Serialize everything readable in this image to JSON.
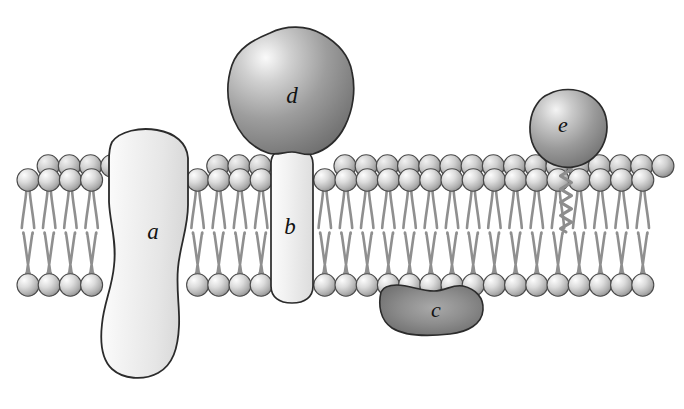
{
  "figure": {
    "background_color": "#ffffff",
    "width": 684,
    "height": 409
  },
  "palette": {
    "outline": "#2b2b2b",
    "head_light": "#f2f2f2",
    "head_mid": "#b9b9b9",
    "head_dark": "#8d8d8d",
    "tail": "#8f8f8f",
    "protein_light_fill": "#ececec",
    "protein_light_highlight": "#fbfbfb",
    "protein_dark_fill": "#8a8a8a",
    "protein_dark_shadow": "#6d6d6d",
    "protein_dark_highlight": "#e8e8e8",
    "label_color": "#121212"
  },
  "membrane": {
    "name": "phospholipid-bilayer",
    "left_x": 28,
    "right_x": 662,
    "outer_leaflet": {
      "name": "outer-leaflet",
      "rows": 2,
      "row_layout": "staggered-double-row",
      "back_row_y": 166,
      "front_row_y": 180,
      "head_radius": 11,
      "spacing": 21.2,
      "tail_top_y": 190,
      "tail_bottom_y": 228
    },
    "inner_leaflet": {
      "name": "inner-leaflet",
      "rows": 1,
      "row_layout": "single-row",
      "head_row_y": 285,
      "head_radius": 11,
      "spacing": 21.2,
      "tail_top_y": 234,
      "tail_bottom_y": 273
    },
    "midline_y": 231,
    "tail_pair_splay": 5.4,
    "tail_width": 2.6
  },
  "proteins": [
    {
      "id": "a",
      "label": "a",
      "name": "protein-a",
      "type": "integral-transmembrane",
      "shade": "light",
      "label_x": 153,
      "label_y": 234,
      "label_size": 23,
      "description": "Large light transmembrane protein with an hourglass profile spanning the bilayer and projecting on both sides."
    },
    {
      "id": "b",
      "label": "b",
      "name": "protein-b",
      "type": "integral-transmembrane",
      "shade": "light",
      "label_x": 290,
      "label_y": 229,
      "label_size": 23,
      "description": "Light rounded-rectangular transmembrane protein spanning the bilayer, capped above by protein d."
    },
    {
      "id": "c",
      "label": "c",
      "name": "protein-c",
      "type": "peripheral-inner-leaflet",
      "shade": "dark",
      "label_x": 436,
      "label_y": 312,
      "label_size": 22,
      "description": "Dark kidney-shaped peripheral protein bound to the cytoplasmic face of the inner leaflet."
    },
    {
      "id": "d",
      "label": "d",
      "name": "protein-d",
      "type": "peripheral-outer-attached",
      "shade": "dark",
      "label_x": 292,
      "label_y": 98,
      "label_size": 23,
      "description": "Dark irregular globular domain resting on the extracellular end of protein b."
    },
    {
      "id": "e",
      "label": "e",
      "name": "protein-e",
      "type": "lipid-anchored",
      "shade": "dark",
      "label_x": 563,
      "label_y": 127,
      "label_size": 22,
      "description": "Dark globular protein tethered to the outer leaflet by a zigzag lipid anchor."
    }
  ],
  "lipid_anchor": {
    "name": "lipid-anchor-zigzag",
    "belongs_to": "e",
    "x": 566,
    "top_y": 166,
    "bottom_y": 232,
    "peaks": 10,
    "amplitude": 5.5
  }
}
